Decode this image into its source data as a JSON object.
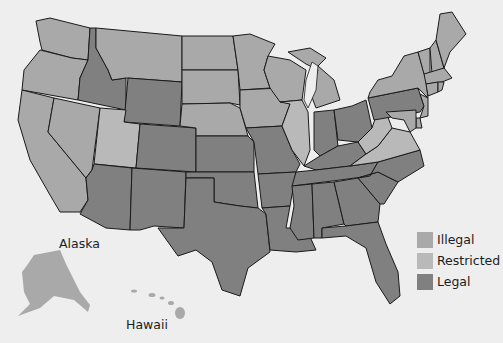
{
  "map": {
    "regions": "United States",
    "insets": [
      {
        "name": "alaska",
        "label": "Alaska",
        "status": "illegal"
      },
      {
        "name": "hawaii",
        "label": "Hawaii",
        "status": "illegal"
      }
    ],
    "states": {
      "WA": "illegal",
      "OR": "illegal",
      "CA": "illegal",
      "NV": "illegal",
      "ID": "legal",
      "MT": "illegal",
      "WY": "legal",
      "UT": "restricted",
      "CO": "legal",
      "AZ": "legal",
      "NM": "legal",
      "ND": "illegal",
      "SD": "illegal",
      "NE": "illegal",
      "KS": "legal",
      "OK": "legal",
      "TX": "legal",
      "MN": "illegal",
      "IA": "illegal",
      "MO": "legal",
      "AR": "legal",
      "LA": "legal",
      "WI": "illegal",
      "IL": "restricted",
      "MI": "illegal",
      "IN": "legal",
      "OH": "legal",
      "KY": "legal",
      "TN": "legal",
      "MS": "legal",
      "AL": "legal",
      "GA": "legal",
      "FL": "legal",
      "SC": "legal",
      "NC": "legal",
      "VA": "restricted",
      "WV": "restricted",
      "PA": "legal",
      "NY": "illegal",
      "VT": "illegal",
      "NH": "illegal",
      "ME": "illegal",
      "MA": "illegal",
      "CT": "illegal",
      "RI": "illegal",
      "NJ": "illegal",
      "DE": "illegal",
      "MD": "illegal"
    }
  },
  "legend": {
    "items": [
      {
        "label": "Illegal",
        "status": "illegal",
        "color": "#a9a9a9"
      },
      {
        "label": "Restricted",
        "status": "restricted",
        "color": "#b9b9b9"
      },
      {
        "label": "Legal",
        "status": "legal",
        "color": "#808080"
      }
    ]
  },
  "labels": {
    "alaska": "Alaska",
    "hawaii": "Hawaii"
  }
}
